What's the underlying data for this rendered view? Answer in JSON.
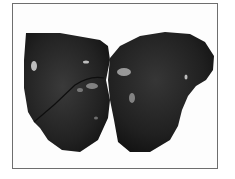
{
  "image": {
    "description": "Grayscale photograph of a dark liver specimen with two lobes on a white background, framed by a thin gray border",
    "colors": {
      "background": "#ffffff",
      "frame_border": "#6e6e6e",
      "specimen_dark": "#1c1c1c",
      "specimen_mid": "#2e2e2e",
      "highlight": "#d8d8d8"
    }
  }
}
